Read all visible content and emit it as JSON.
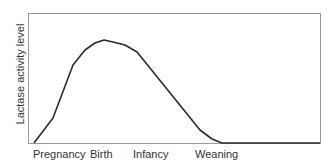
{
  "chart_data": {
    "type": "line",
    "title": "",
    "xlabel": "",
    "ylabel": "Lactase activity level",
    "x_tick_labels": [
      "Pregnancy",
      "Birth",
      "Infancy",
      "Weaning"
    ],
    "grid": false,
    "legend": null,
    "series": [
      {
        "name": "Lactase activity",
        "points_px": [
          [
            34,
            143
          ],
          [
            53,
            118
          ],
          [
            73,
            65
          ],
          [
            85,
            50
          ],
          [
            95,
            43
          ],
          [
            104,
            40
          ],
          [
            113,
            42
          ],
          [
            125,
            45
          ],
          [
            137,
            52
          ],
          [
            200,
            130
          ],
          [
            212,
            139
          ],
          [
            222,
            143
          ],
          [
            320,
            143
          ]
        ]
      }
    ],
    "note": "Qualitative curve: rises during pregnancy, peaks around birth, declines through infancy, near zero after weaning"
  },
  "colors": {
    "frame": "#9a9a9a",
    "line": "#2b2b2b",
    "text": "#333333"
  }
}
